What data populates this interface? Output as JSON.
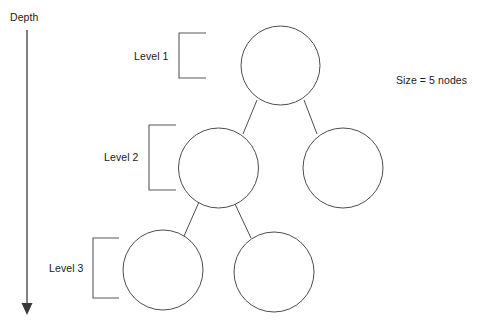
{
  "diagram": {
    "type": "binary-tree",
    "title_labels": {
      "depth_axis": "Depth",
      "level_1": "Level 1",
      "level_2": "Level 2",
      "level_3": "Level 3",
      "size_annotation": "Size = 5 nodes"
    },
    "colors": {
      "node_stroke": "#4d4d4d",
      "node_fill": "#ffffff",
      "edge_stroke": "#4d4d4d",
      "bracket_stroke": "#595959",
      "axis_stroke": "#4a4a4a",
      "text": "#1a1a1a",
      "background": "#ffffff"
    },
    "node_count": 5,
    "level_count": 3,
    "nodes": [
      {
        "id": "root",
        "level": 1,
        "cx": 280.5,
        "cy": 65.5,
        "r": 39.5,
        "label": ""
      },
      {
        "id": "left-child",
        "level": 2,
        "cx": 218.5,
        "cy": 168.0,
        "r": 40.0,
        "label": ""
      },
      {
        "id": "right-child",
        "level": 2,
        "cx": 343.0,
        "cy": 168.0,
        "r": 40.0,
        "label": ""
      },
      {
        "id": "left-leaf",
        "level": 3,
        "cx": 163.0,
        "cy": 270.0,
        "r": 40.0,
        "label": ""
      },
      {
        "id": "right-leaf",
        "level": 3,
        "cx": 274.0,
        "cy": 272.0,
        "r": 40.0,
        "label": ""
      }
    ],
    "edges": [
      {
        "from": "root",
        "to": "left-child",
        "x1": 257,
        "y1": 100,
        "x2": 243,
        "y2": 134
      },
      {
        "from": "root",
        "to": "right-child",
        "x1": 304,
        "y1": 100,
        "x2": 317,
        "y2": 134
      },
      {
        "from": "left-child",
        "to": "left-leaf",
        "x1": 199,
        "y1": 202,
        "x2": 184,
        "y2": 236
      },
      {
        "from": "left-child",
        "to": "right-leaf",
        "x1": 235,
        "y1": 204,
        "x2": 251,
        "y2": 238
      }
    ],
    "brackets": [
      {
        "level": 1,
        "x_right": 206,
        "x_left": 179,
        "y_top": 33,
        "y_bottom": 78
      },
      {
        "level": 2,
        "x_right": 176,
        "x_left": 149,
        "y_top": 125,
        "y_bottom": 190
      },
      {
        "level": 3,
        "x_right": 119,
        "x_left": 93,
        "y_top": 238,
        "y_bottom": 298
      }
    ],
    "depth_arrow": {
      "x": 27,
      "y_top": 30,
      "y_bottom": 305,
      "head_width": 11,
      "head_height": 12
    }
  }
}
